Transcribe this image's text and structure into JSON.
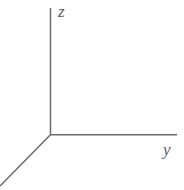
{
  "figure": {
    "type": "coordinate-axes-diagram",
    "background_color": "#ffffff",
    "line_color": "#6b6b6b",
    "label_color": "#5e5e5e",
    "line_width": 1.5,
    "width": 184,
    "height": 190,
    "origin": {
      "x": 50,
      "y": 135
    },
    "axes": [
      {
        "name": "z-axis",
        "label": "z",
        "direction": "up",
        "from": {
          "x": 50,
          "y": 135
        },
        "to": {
          "x": 50,
          "y": 8
        },
        "label_position": {
          "x": 58,
          "y": 3
        }
      },
      {
        "name": "y-axis",
        "label": "y",
        "direction": "right",
        "from": {
          "x": 50,
          "y": 135
        },
        "to": {
          "x": 177,
          "y": 135
        },
        "label_position": {
          "x": 163,
          "y": 141
        }
      },
      {
        "name": "x-axis",
        "label": "",
        "direction": "down-left",
        "from": {
          "x": 50,
          "y": 135
        },
        "to": {
          "x": 0,
          "y": 186
        },
        "label_position": null
      }
    ]
  }
}
